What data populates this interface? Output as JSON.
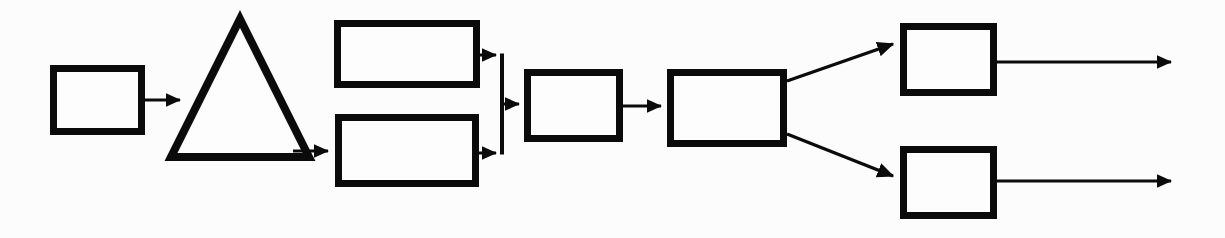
{
  "diagram": {
    "type": "flowchart",
    "orientation": "left-to-right",
    "canvas": {
      "width": 1225,
      "height": 238
    },
    "style": {
      "background_color": "#fcfcfc",
      "line_color": "#0b0b0b",
      "shape_fill": "#fdfdfd",
      "stroke_width_thick": 7,
      "stroke_width_thin": 3
    },
    "nodes": [
      {
        "id": "node-1",
        "shape": "rectangle",
        "label": "",
        "x": 50,
        "y": 65,
        "width": 95,
        "height": 70,
        "stroke_width": 7
      },
      {
        "id": "node-2",
        "shape": "triangle",
        "label": "",
        "apex_x": 240,
        "apex_y": 15,
        "base_left_x": 173,
        "base_right_x": 313,
        "base_y": 160,
        "stroke_width": 8
      },
      {
        "id": "node-3a",
        "shape": "rectangle",
        "label": "",
        "x": 334,
        "y": 20,
        "width": 146,
        "height": 68,
        "stroke_width": 7
      },
      {
        "id": "node-3b",
        "shape": "rectangle",
        "label": "",
        "x": 335,
        "y": 114,
        "width": 144,
        "height": 73,
        "stroke_width": 7
      },
      {
        "id": "node-4",
        "shape": "rectangle",
        "label": "",
        "x": 524,
        "y": 69,
        "width": 99,
        "height": 73,
        "stroke_width": 7
      },
      {
        "id": "node-5",
        "shape": "rectangle",
        "label": "",
        "x": 667,
        "y": 69,
        "width": 120,
        "height": 78,
        "stroke_width": 7
      },
      {
        "id": "node-6a",
        "shape": "rectangle",
        "label": "",
        "x": 900,
        "y": 23,
        "width": 97,
        "height": 73,
        "stroke_width": 7
      },
      {
        "id": "node-6b",
        "shape": "rectangle",
        "label": "",
        "x": 900,
        "y": 146,
        "width": 97,
        "height": 73,
        "stroke_width": 7
      }
    ],
    "merge_bar": {
      "id": "merge-bar-1",
      "x": 502,
      "y_top": 55,
      "y_bottom": 153,
      "stroke_width": 3
    },
    "split_bar": {
      "id": "split-point-1",
      "x": 787,
      "y_top": 81,
      "y_bottom": 134
    },
    "edges": [
      {
        "id": "edge-1",
        "from": "node-1",
        "to": "node-2",
        "label": "",
        "path": "M145,100 L186,100",
        "arrow": "end"
      },
      {
        "id": "edge-2",
        "from": "node-2",
        "to": "node-3b",
        "label": "",
        "path": "M297,151 L333,151",
        "arrow": "end"
      },
      {
        "id": "edge-3",
        "from": "node-3a",
        "to": "merge-bar-1",
        "label": "",
        "path": "M480,55 L501,55",
        "arrow": "end"
      },
      {
        "id": "edge-4",
        "from": "node-3b",
        "to": "merge-bar-1",
        "label": "",
        "path": "M479,153 L501,153",
        "arrow": "end"
      },
      {
        "id": "edge-5",
        "from": "merge-bar-1",
        "to": "node-4",
        "label": "",
        "path": "M502,104 L523,104",
        "arrow": "end"
      },
      {
        "id": "edge-6",
        "from": "node-4",
        "to": "node-5",
        "label": "",
        "path": "M623,106 L666,106",
        "arrow": "end"
      },
      {
        "id": "edge-7",
        "from": "node-5",
        "to": "node-6a",
        "label": "",
        "path": "M787,81 L899,42",
        "arrow": "end"
      },
      {
        "id": "edge-8",
        "from": "node-5",
        "to": "node-6b",
        "label": "",
        "path": "M787,134 L899,179",
        "arrow": "end"
      },
      {
        "id": "edge-9",
        "from": "node-6a",
        "to": "output-1",
        "label": "",
        "path": "M997,62 L1177,62",
        "arrow": "end"
      },
      {
        "id": "edge-10",
        "from": "node-6b",
        "to": "output-2",
        "label": "",
        "path": "M997,181 L1177,181",
        "arrow": "end"
      }
    ]
  }
}
